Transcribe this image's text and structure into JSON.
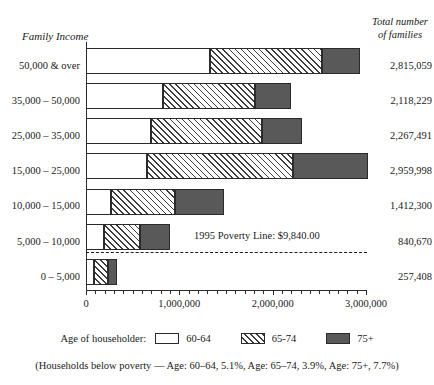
{
  "headings": {
    "y_axis_title": "Family Income",
    "right_title_line1": "Total number",
    "right_title_line2": "of families"
  },
  "annotation": {
    "poverty_label": "1995 Poverty Line: $9,840.00"
  },
  "legend": {
    "title": "Age of householder:",
    "items": [
      {
        "label": "60-64",
        "key": "s60",
        "swatch": "white-box-swatch"
      },
      {
        "label": "65-74",
        "key": "s65",
        "swatch": "hatched-box-swatch"
      },
      {
        "label": "75+",
        "key": "s75",
        "swatch": "dark-box-swatch"
      }
    ]
  },
  "footnote": "(Households below poverty — Age: 60–64, 5.1%, Age: 65–74, 3.9%, Age: 75+, 7.7%)",
  "axis": {
    "tick_labels": [
      "0",
      "1,000,000",
      "2,000,000",
      "3,000,000"
    ],
    "tick_values": [
      0,
      1000000,
      2000000,
      3000000
    ]
  },
  "chart_data": {
    "type": "bar",
    "orientation": "horizontal",
    "stacked": true,
    "title": "",
    "xlabel": "",
    "ylabel": "Family Income",
    "xlim": [
      0,
      3000000
    ],
    "grid": false,
    "legend_position": "bottom",
    "categories": [
      "50,000 & over",
      "35,000 – 50,000",
      "25,000 – 35,000",
      "15,000 – 25,000",
      "10,000 – 15,000",
      "5,000 – 10,000",
      "0 – 5,000"
    ],
    "series": [
      {
        "name": "60-64",
        "values": [
          1329000,
          825000,
          696000,
          654000,
          268000,
          193000,
          86000
        ]
      },
      {
        "name": "65-74",
        "values": [
          1200000,
          986000,
          1190000,
          1564000,
          686000,
          386000,
          150000
        ]
      },
      {
        "name": "75+",
        "values": [
          407000,
          386000,
          429000,
          803000,
          525000,
          322000,
          96000
        ]
      }
    ],
    "totals": [
      "2,815,059",
      "2,118,229",
      "2,267,491",
      "2,959,998",
      "1,412,300",
      "840,670",
      "257,408"
    ],
    "total_values": [
      2815059,
      2118229,
      2267491,
      2959998,
      1412300,
      840670,
      257408
    ],
    "annotations": [
      {
        "text": "1995 Poverty Line: $9,840.00",
        "type": "dashed-horizontal-line",
        "between": [
          "10,000 – 15,000",
          "5,000 – 10,000"
        ]
      }
    ],
    "footnote": "(Households below poverty — Age: 60–64, 5.1%, Age: 65–74, 3.9%, Age: 75+, 7.7%)"
  }
}
